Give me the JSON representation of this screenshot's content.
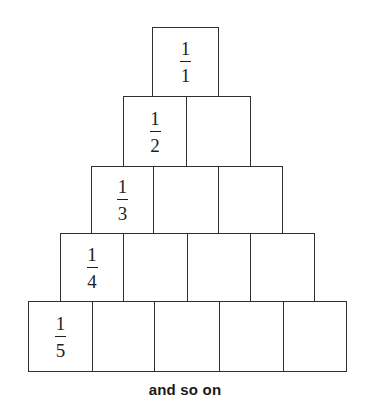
{
  "diagram": {
    "type": "fraction-pyramid",
    "line_color": "#2f2f2f",
    "rows": [
      {
        "row": 1,
        "cells": 1,
        "fraction": {
          "numerator": "1",
          "denominator": "1"
        },
        "top": 27,
        "bottom": 96,
        "edges": [
          152,
          218
        ]
      },
      {
        "row": 2,
        "cells": 2,
        "fraction": {
          "numerator": "1",
          "denominator": "2"
        },
        "top": 96,
        "bottom": 166,
        "edges": [
          123,
          186,
          250
        ]
      },
      {
        "row": 3,
        "cells": 3,
        "fraction": {
          "numerator": "1",
          "denominator": "3"
        },
        "top": 166,
        "bottom": 233,
        "edges": [
          91,
          153,
          218,
          282
        ]
      },
      {
        "row": 4,
        "cells": 4,
        "fraction": {
          "numerator": "1",
          "denominator": "4"
        },
        "top": 233,
        "bottom": 301,
        "edges": [
          60,
          123,
          187,
          250,
          314
        ]
      },
      {
        "row": 5,
        "cells": 5,
        "fraction": {
          "numerator": "1",
          "denominator": "5"
        },
        "top": 301,
        "bottom": 371,
        "edges": [
          28,
          92,
          154,
          219,
          283,
          346
        ]
      }
    ],
    "caption": "and so on"
  }
}
